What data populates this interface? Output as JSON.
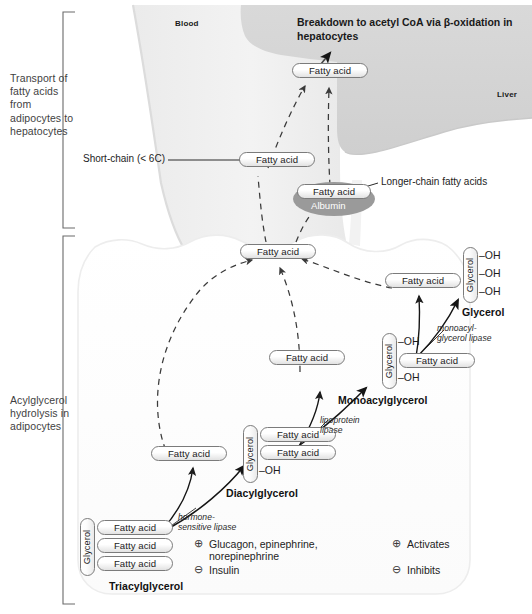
{
  "figure": {
    "sections": [
      {
        "id": "transport",
        "label": "Transport of\nfatty acids from\nadipocytes to\nhepatocytes"
      },
      {
        "id": "hydrolysis",
        "label": "Acylglycerol\nhydrolysis in\nadipocytes"
      }
    ],
    "regions": {
      "blood_label": "Blood",
      "liver_label": "Liver",
      "blood_color": "#f0f0f0",
      "liver_color": "#d6d6d6",
      "adipocyte_color": "#ffffff",
      "albumin_color": "#9a9a9a"
    },
    "headline": "Breakdown to acetyl CoA via β-oxidation in\nhepatocytes",
    "callouts": [
      {
        "id": "short-chain",
        "text": "Short-chain (< 6C)"
      },
      {
        "id": "longer-chain",
        "text": "Longer-chain fatty acids"
      }
    ],
    "metabolites": {
      "fatty_acid": "Fatty acid",
      "glycerol": "Glycerol",
      "albumin": "Albumin",
      "hydroxyl": "OH"
    },
    "compounds": [
      {
        "id": "triacylglycerol",
        "name": "Triacylglycerol",
        "backbone": "Glycerol",
        "groups": [
          "Fatty acid",
          "Fatty acid",
          "Fatty acid"
        ]
      },
      {
        "id": "diacylglycerol",
        "name": "Diacylglycerol",
        "backbone": "Glycerol",
        "groups": [
          "Fatty acid",
          "Fatty acid",
          "OH"
        ]
      },
      {
        "id": "monoacylglycerol",
        "name": "Monoacylglycerol",
        "backbone": "Glycerol",
        "groups": [
          "OH",
          "Fatty acid",
          "OH"
        ]
      },
      {
        "id": "glycerol",
        "name": "Glycerol",
        "backbone": "Glycerol",
        "groups": [
          "OH",
          "OH",
          "OH"
        ]
      }
    ],
    "enzymes": [
      {
        "id": "hormone-sensitive-lipase",
        "text": "hormone-\nsensitive lipase"
      },
      {
        "id": "lipoprotein-lipase",
        "text": "lipoprotein\nlipase"
      },
      {
        "id": "monoacylglycerol-lipase",
        "text": "monoacyl-\nglycerol lipase"
      }
    ],
    "regulators": [
      {
        "symbol": "⊕",
        "text": "Glucagon, epinephrine,\nnorepinephrine"
      },
      {
        "symbol": "⊖",
        "text": "Insulin"
      }
    ],
    "legend": [
      {
        "symbol": "⊕",
        "text": "Activates"
      },
      {
        "symbol": "⊖",
        "text": "Inhibits"
      }
    ]
  }
}
